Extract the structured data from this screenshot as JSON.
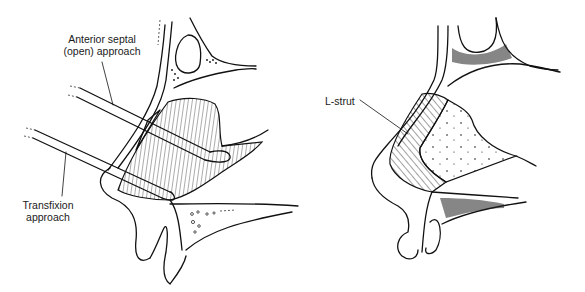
{
  "figure": {
    "left_panel": {
      "title": "Surgical approaches to the nasal septum",
      "labels": {
        "anterior_line1": "Anterior septal",
        "anterior_line2": "(open) approach",
        "transfixion_line1": "Transfixion",
        "transfixion_line2": "approach"
      }
    },
    "right_panel": {
      "labels": {
        "l_strut": "L-strut"
      }
    }
  },
  "colors": {
    "ink": "#111111",
    "background": "#ffffff"
  }
}
